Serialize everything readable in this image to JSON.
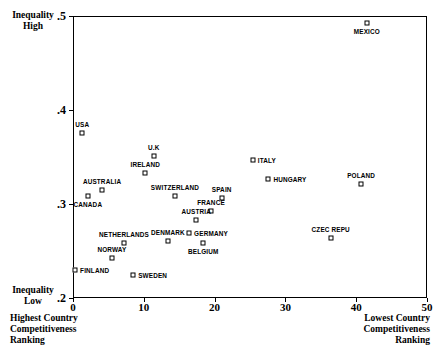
{
  "chart_data": {
    "type": "scatter",
    "title": "",
    "xlabel": "",
    "ylabel": "",
    "xlim": [
      0,
      50
    ],
    "ylim": [
      0.2,
      0.5
    ],
    "grid": false,
    "legend": "none",
    "xticks": [
      0,
      10,
      20,
      30,
      40,
      50
    ],
    "xtick_labels": [
      "0",
      "10",
      "20",
      "30",
      "40",
      "50"
    ],
    "yticks": [
      0.2,
      0.3,
      0.4,
      0.5
    ],
    "ytick_labels": [
      ".2",
      ".3",
      ".4",
      ".5"
    ],
    "axis_end_labels": {
      "y_top": "Inequality\nHigh",
      "y_top_line1": "Inequality",
      "y_top_line2": "High",
      "y_bottom_line1": "Inequality",
      "y_bottom_line2": "Low",
      "x_left_line1": "Highest Country",
      "x_left_line2": "Competitiveness",
      "x_left_line3": "Ranking",
      "x_right_line1": "Lowest Country",
      "x_right_line2": "Competitiveness",
      "x_right_line3": "Ranking"
    },
    "points": [
      {
        "label": "MEXICO",
        "x": 41.5,
        "y": 0.4925,
        "label_pos": "below"
      },
      {
        "label": "USA",
        "x": 1.3,
        "y": 0.3755,
        "label_pos": "above"
      },
      {
        "label": "U.K",
        "x": 11.4,
        "y": 0.351,
        "label_pos": "above"
      },
      {
        "label": "ITALY",
        "x": 25.4,
        "y": 0.347,
        "label_pos": "right"
      },
      {
        "label": "IRELAND",
        "x": 10.2,
        "y": 0.333,
        "label_pos": "above"
      },
      {
        "label": "HUNGARY",
        "x": 27.6,
        "y": 0.327,
        "label_pos": "right"
      },
      {
        "label": "POLAND",
        "x": 40.7,
        "y": 0.3215,
        "label_pos": "above"
      },
      {
        "label": "AUSTRALIA",
        "x": 4.1,
        "y": 0.3145,
        "label_pos": "above"
      },
      {
        "label": "SWITZERLAND",
        "x": 14.4,
        "y": 0.3085,
        "label_pos": "above"
      },
      {
        "label": "SPAIN",
        "x": 21.0,
        "y": 0.306,
        "label_pos": "above"
      },
      {
        "label": "CANADA",
        "x": 2.1,
        "y": 0.3085,
        "label_pos": "below"
      },
      {
        "label": "FRANCE",
        "x": 19.5,
        "y": 0.2925,
        "label_pos": "above"
      },
      {
        "label": "AUSTRIA",
        "x": 17.4,
        "y": 0.283,
        "label_pos": "above"
      },
      {
        "label": "GERMANY",
        "x": 16.4,
        "y": 0.2692,
        "label_pos": "right"
      },
      {
        "label": "DENMARK",
        "x": 13.4,
        "y": 0.2606,
        "label_pos": "above"
      },
      {
        "label": "NETHERLANDS",
        "x": 7.2,
        "y": 0.2585,
        "label_pos": "above"
      },
      {
        "label": "BELGIUM",
        "x": 18.4,
        "y": 0.2585,
        "label_pos": "below"
      },
      {
        "label": "CZEC REPU",
        "x": 36.4,
        "y": 0.2638,
        "label_pos": "above"
      },
      {
        "label": "NORWAY",
        "x": 5.5,
        "y": 0.2426,
        "label_pos": "above"
      },
      {
        "label": "FINLAND",
        "x": 0.3,
        "y": 0.2298,
        "label_pos": "right"
      },
      {
        "label": "SWEDEN",
        "x": 8.5,
        "y": 0.2245,
        "label_pos": "right"
      }
    ]
  }
}
